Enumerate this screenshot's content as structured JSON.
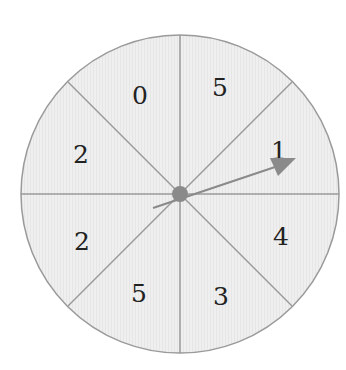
{
  "spinner": {
    "sections": [
      {
        "label": "0",
        "position": "upper-left-top"
      },
      {
        "label": "5",
        "position": "upper-right-top"
      },
      {
        "label": "1",
        "position": "right-upper"
      },
      {
        "label": "4",
        "position": "right-lower"
      },
      {
        "label": "3",
        "position": "lower-right"
      },
      {
        "label": "5",
        "position": "lower-left"
      },
      {
        "label": "2",
        "position": "left-lower"
      },
      {
        "label": "2",
        "position": "left-upper"
      }
    ],
    "colors": {
      "fill": "#eeeeee",
      "stroke": "#9a9a9a",
      "pointer": "#8a8a8a",
      "text": "#222222"
    }
  }
}
